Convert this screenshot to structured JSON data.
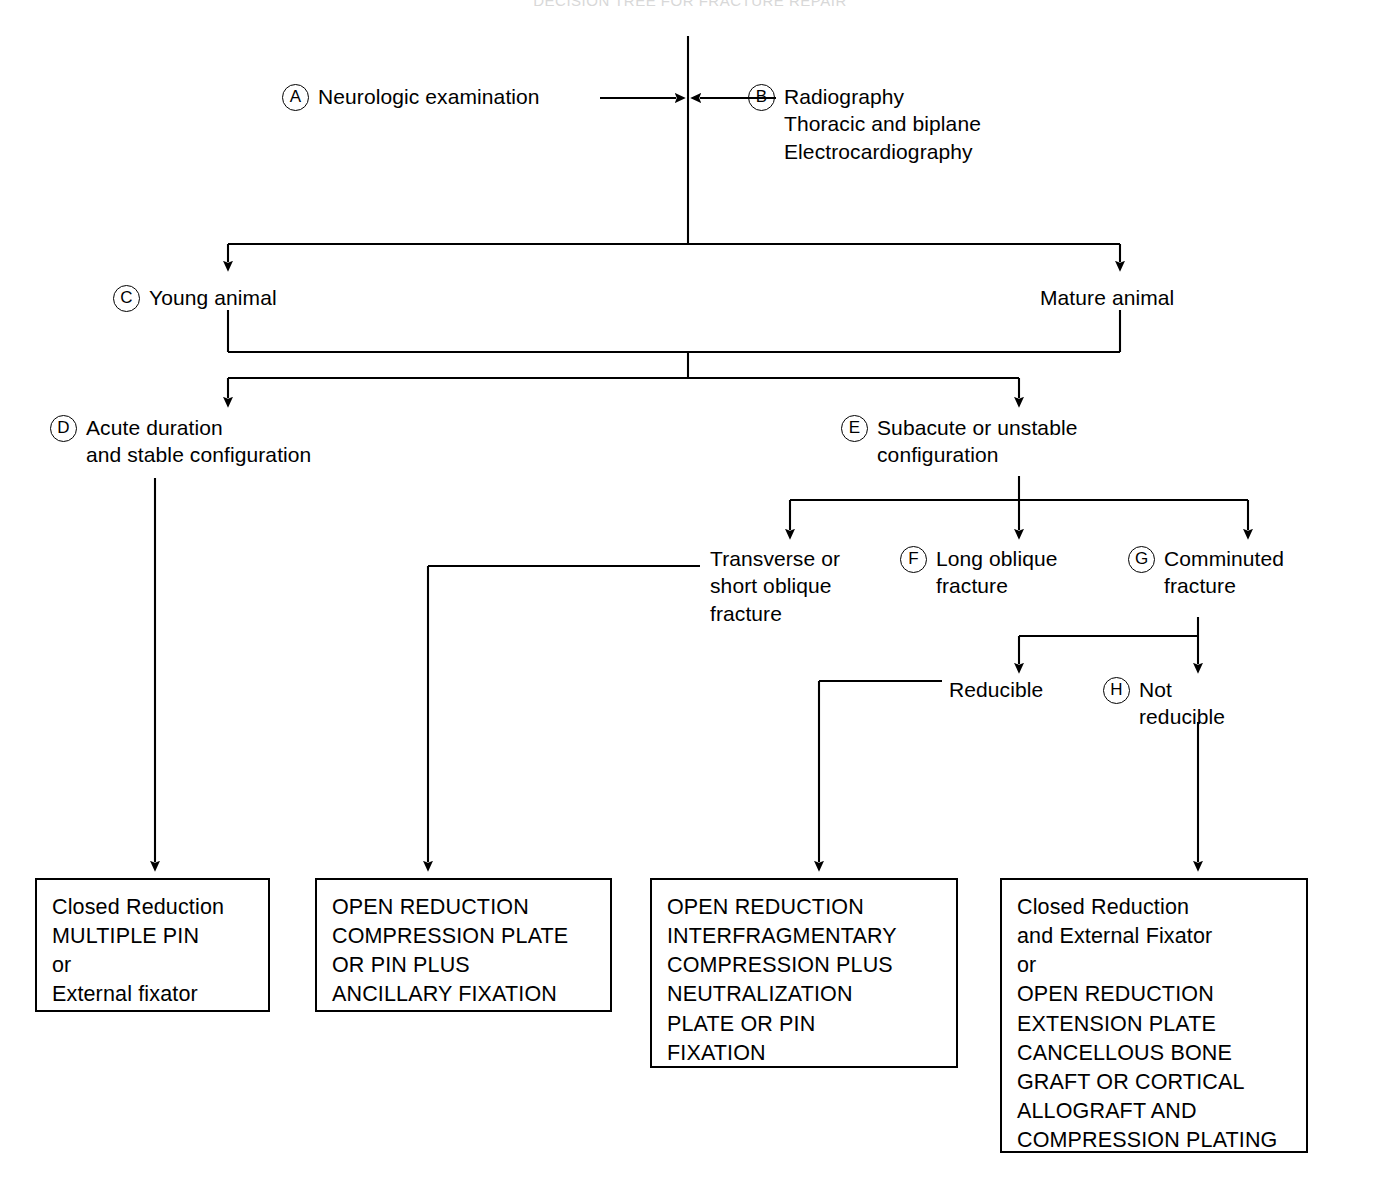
{
  "figure": {
    "title_faint": "DECISION TREE FOR FRACTURE REPAIR",
    "type": "clinical decision tree flowchart",
    "line_color": "#000000",
    "background_color": "#ffffff"
  },
  "nodes": {
    "a": {
      "marker": "A",
      "text": "Neurologic examination"
    },
    "b": {
      "marker": "B",
      "text": "Radiography\nThoracic and biplane\nElectrocardiography"
    },
    "c": {
      "marker": "C",
      "text": "Young animal"
    },
    "mature": {
      "marker": "",
      "text": "Mature animal"
    },
    "d": {
      "marker": "D",
      "text": "Acute duration\nand stable configuration"
    },
    "e": {
      "marker": "E",
      "text": "Subacute or unstable\nconfiguration"
    },
    "transverse": {
      "marker": "",
      "text": "Transverse or\nshort oblique\nfracture"
    },
    "f": {
      "marker": "F",
      "text": "Long oblique\nfracture"
    },
    "g": {
      "marker": "G",
      "text": "Comminuted\nfracture"
    },
    "reducible": {
      "marker": "",
      "text": "Reducible"
    },
    "h": {
      "marker": "H",
      "text": "Not\nreducible"
    }
  },
  "outcome_boxes": {
    "box1": {
      "text": "Closed Reduction\nMULTIPLE PIN\nor\nExternal fixator"
    },
    "box2": {
      "text": "OPEN REDUCTION\nCOMPRESSION PLATE\nOR PIN PLUS\nANCILLARY FIXATION"
    },
    "box3": {
      "text": "OPEN REDUCTION\nINTERFRAGMENTARY\nCOMPRESSION PLUS\nNEUTRALIZATION\nPLATE OR PIN\nFIXATION"
    },
    "box4": {
      "text": "Closed Reduction\nand External Fixator\nor\nOPEN REDUCTION\nEXTENSION PLATE\nCANCELLOUS BONE\nGRAFT OR CORTICAL\nALLOGRAFT AND\nCOMPRESSION PLATING"
    }
  }
}
